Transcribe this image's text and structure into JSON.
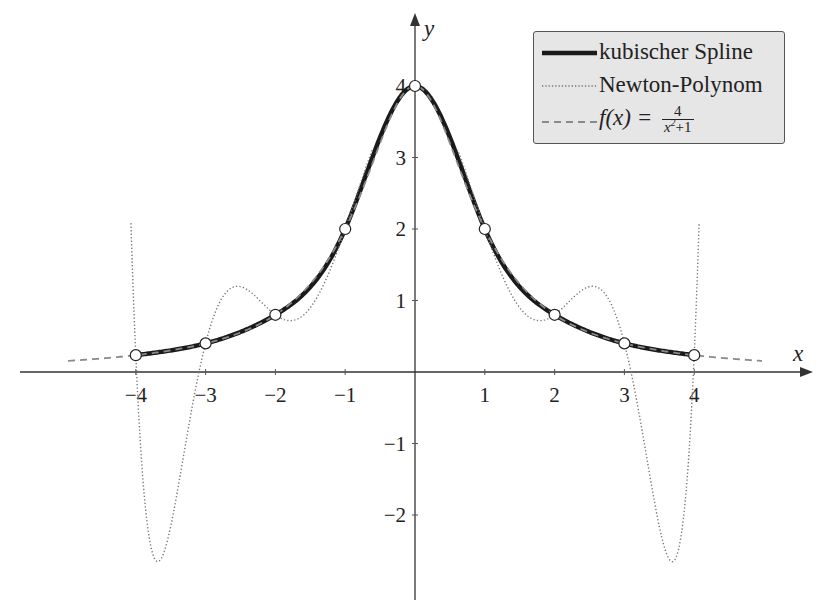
{
  "chart_data": {
    "type": "line",
    "title": "",
    "xlabel": "x",
    "ylabel": "y",
    "xlim": [
      -5.95,
      5.7
    ],
    "ylim": [
      -3.2,
      5.0
    ],
    "grid": false,
    "legend_position": "upper right",
    "x_ticks": [
      -4,
      -3,
      -2,
      -1,
      1,
      2,
      3,
      4
    ],
    "x_tick_labels": [
      "−4",
      "−3",
      "−2",
      "−1",
      "1",
      "2",
      "3",
      "4"
    ],
    "y_ticks": [
      -2,
      -1,
      1,
      2,
      3,
      4
    ],
    "y_tick_labels": [
      "−2",
      "−1",
      "1",
      "2",
      "3",
      "4"
    ],
    "nodes": {
      "x": [
        -4,
        -3,
        -2,
        -1,
        0,
        1,
        2,
        3,
        4
      ],
      "y": [
        0.2353,
        0.4,
        0.8,
        2,
        4,
        2,
        0.8,
        0.4,
        0.2353
      ]
    },
    "series": [
      {
        "name": "kubischer Spline",
        "style": "solid",
        "color": "#1a1a1a",
        "domain": [
          -4,
          4
        ],
        "description": "natural cubic spline through nodes"
      },
      {
        "name": "Newton-Polynom",
        "style": "dotted",
        "color": "#777777",
        "domain": [
          -4.07,
          4.07
        ],
        "description": "degree-8 interpolation polynomial through nodes",
        "extrema": [
          {
            "x": -3.65,
            "y": -2.66
          },
          {
            "x": -2.54,
            "y": 1.19
          },
          {
            "x": -1.8,
            "y": 0.7
          },
          {
            "x": 0,
            "y": 4
          },
          {
            "x": 1.8,
            "y": 0.7
          },
          {
            "x": 2.54,
            "y": 1.19
          },
          {
            "x": 3.65,
            "y": -2.66
          }
        ]
      },
      {
        "name": "f(x) = 4/(x²+1)",
        "style": "dashed",
        "color": "#8a8a8a",
        "domain": [
          -4.97,
          4.97
        ],
        "formula": "4/(x^2+1)"
      }
    ]
  },
  "legend": {
    "items": [
      {
        "label": "kubischer Spline",
        "style": "solid"
      },
      {
        "label": "Newton-Polynom",
        "style": "dotted"
      },
      {
        "label_prefix": "f(x) = ",
        "frac_num": "4",
        "frac_den_base": "x",
        "frac_den_sup": "2",
        "frac_den_rest": "+1",
        "style": "dashed"
      }
    ]
  },
  "axes": {
    "x_label": "x",
    "y_label": "y"
  }
}
